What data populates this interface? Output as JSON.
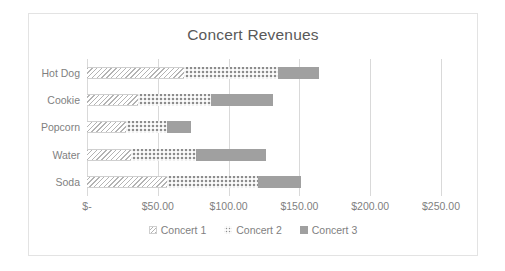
{
  "chart_data": {
    "type": "bar",
    "orientation": "horizontal",
    "stacked": true,
    "title": "Concert Revenues",
    "xlabel": "",
    "ylabel": "",
    "categories": [
      "Hot Dog",
      "Cookie",
      "Popcorn",
      "Water",
      "Soda"
    ],
    "series": [
      {
        "name": "Concert 1",
        "values": [
          68.5,
          36.0,
          27.5,
          31.0,
          56.5
        ],
        "pattern": "diagonal-hatch",
        "color": "#b3b3b3"
      },
      {
        "name": "Concert 2",
        "values": [
          66.5,
          51.5,
          29.0,
          46.0,
          64.0
        ],
        "pattern": "dotted",
        "color": "#8c8c8c"
      },
      {
        "name": "Concert 3",
        "values": [
          29.0,
          44.0,
          17.0,
          49.5,
          30.5
        ],
        "pattern": "solid",
        "color": "#a0a0a0"
      }
    ],
    "totals": [
      164.0,
      131.5,
      73.5,
      126.5,
      151.0
    ],
    "xlim": [
      0,
      250
    ],
    "xticks": [
      0,
      50,
      100,
      150,
      200,
      250
    ],
    "xticklabels": [
      "$-",
      "$50.00",
      "$100.00",
      "$150.00",
      "$200.00",
      "$250.00"
    ],
    "grid": true,
    "legend_position": "bottom",
    "legend": [
      "Concert 1",
      "Concert 2",
      "Concert 3"
    ]
  },
  "style": {
    "text_color": "#7f7f7f",
    "title_color": "#595959",
    "grid_color": "#d9d9d9",
    "border_color": "#e3e3e3",
    "background": "#ffffff"
  }
}
